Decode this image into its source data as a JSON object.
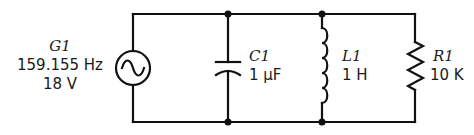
{
  "diagram": {
    "type": "parallel RLC circuit",
    "stroke_color": "#111111",
    "components": {
      "source": {
        "ref": "G1",
        "frequency": "159.155 Hz",
        "voltage": "18 V",
        "symbol": "ac-source"
      },
      "capacitor": {
        "ref": "C1",
        "value": "1 μF",
        "symbol": "capacitor"
      },
      "inductor": {
        "ref": "L1",
        "value": "1 H",
        "symbol": "inductor"
      },
      "resistor": {
        "ref": "R1",
        "value": "10 K",
        "symbol": "resistor"
      }
    },
    "junctions": 4
  }
}
